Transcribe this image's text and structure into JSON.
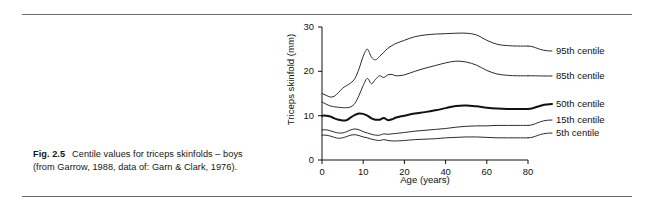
{
  "caption": {
    "figure_label": "Fig. 2.5",
    "text": "Centile values for triceps skinfolds – boys (from Garrow, 1988, data of: Garn & Clark, 1976)."
  },
  "chart_data": {
    "type": "line",
    "title": "",
    "xlabel": "Age (years)",
    "ylabel": "Triceps skinfold (mm)",
    "xlim": [
      0,
      80
    ],
    "ylim": [
      0,
      30
    ],
    "grid": false,
    "legend_position": "right",
    "x_ticks": [
      0,
      10,
      20,
      40,
      60,
      80
    ],
    "y_ticks": [
      0,
      10,
      20,
      30
    ],
    "x_axis_note": "non-linear: ticks evenly spaced at 0,10,20,40,60,80",
    "x": [
      0,
      1,
      2,
      3,
      4,
      5,
      6,
      7,
      8,
      9,
      10,
      11,
      12,
      13,
      14,
      15,
      16,
      17,
      18,
      20,
      25,
      30,
      35,
      40,
      45,
      50,
      55,
      60,
      65,
      70,
      75,
      80
    ],
    "series": [
      {
        "name": "95th centile",
        "label": "95th centile",
        "color": "#2b2b2b",
        "width": 1,
        "values": [
          15.0,
          14.6,
          14.2,
          14.4,
          15.2,
          16.2,
          16.8,
          17.4,
          18.4,
          20.6,
          23.4,
          25.0,
          23.2,
          22.6,
          23.4,
          24.3,
          25.2,
          25.8,
          26.3,
          27.0,
          27.8,
          28.2,
          28.4,
          28.5,
          28.6,
          28.6,
          28.2,
          27.0,
          26.1,
          25.8,
          25.7,
          25.7
        ]
      },
      {
        "name": "85th centile",
        "label": "85th centile",
        "color": "#2b2b2b",
        "width": 1,
        "values": [
          13.1,
          12.6,
          12.2,
          12.0,
          11.9,
          11.8,
          11.8,
          12.0,
          12.8,
          14.6,
          16.8,
          18.4,
          17.2,
          18.2,
          19.0,
          18.6,
          19.2,
          19.3,
          19.0,
          19.2,
          20.0,
          20.7,
          21.3,
          21.9,
          22.3,
          22.1,
          21.4,
          20.2,
          19.4,
          19.1,
          19.0,
          19.0
        ]
      },
      {
        "name": "50th centile",
        "label": "50th centile",
        "color": "#111111",
        "width": 2,
        "values": [
          10.0,
          10.0,
          9.8,
          9.4,
          9.1,
          8.9,
          9.0,
          9.6,
          10.2,
          10.5,
          10.4,
          10.0,
          9.4,
          9.1,
          9.1,
          9.5,
          9.0,
          9.2,
          9.6,
          10.0,
          10.5,
          10.8,
          11.2,
          11.7,
          12.2,
          12.3,
          12.1,
          11.8,
          11.6,
          11.5,
          11.5,
          11.5
        ]
      },
      {
        "name": "15th centile",
        "label": "15th centile",
        "color": "#2b2b2b",
        "width": 1,
        "values": [
          6.8,
          6.8,
          6.6,
          6.3,
          6.1,
          6.1,
          6.4,
          6.8,
          7.0,
          6.8,
          6.4,
          6.1,
          5.8,
          5.6,
          5.6,
          5.9,
          5.8,
          5.9,
          6.0,
          6.2,
          6.5,
          6.7,
          6.9,
          7.1,
          7.4,
          7.6,
          7.7,
          7.7,
          7.8,
          7.8,
          7.8,
          7.8
        ]
      },
      {
        "name": "5th centile",
        "label": "5th centile",
        "color": "#2b2b2b",
        "width": 1,
        "values": [
          5.6,
          5.6,
          5.4,
          5.1,
          4.9,
          5.0,
          5.3,
          5.6,
          5.7,
          5.5,
          5.2,
          5.0,
          4.7,
          4.5,
          4.4,
          4.6,
          4.4,
          4.3,
          4.3,
          4.4,
          4.6,
          4.7,
          4.8,
          5.0,
          5.1,
          5.2,
          5.2,
          5.1,
          5.0,
          5.0,
          5.0,
          5.0
        ]
      }
    ]
  }
}
